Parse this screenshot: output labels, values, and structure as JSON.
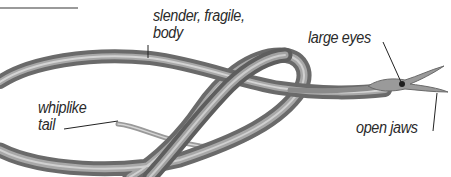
{
  "diagram": {
    "labels": {
      "body": {
        "line1": "slender, fragile,",
        "line2": "body"
      },
      "eyes": "large eyes",
      "tail": {
        "line1": "whiplike",
        "line2": "tail"
      },
      "jaws": "open jaws"
    },
    "colors": {
      "body_dark": "#5a5a5a",
      "body_mid": "#8a8a8a",
      "body_light": "#c8c8c8",
      "leader_line": "#222222",
      "top_rule": "#9a9a9a",
      "text": "#2a2a2a"
    }
  }
}
